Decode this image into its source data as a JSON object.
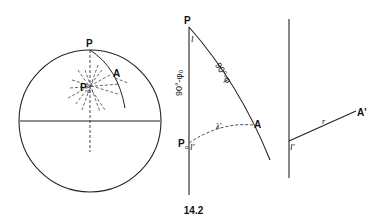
{
  "figure": {
    "caption": "14.2",
    "panel_left": {
      "label_pole": "P",
      "label_point": "A",
      "label_origin": "P",
      "label_origin_sub": "o"
    },
    "panel_middle": {
      "label_pole": "P",
      "label_point": "A",
      "label_origin": "P",
      "label_origin_sub": "o",
      "label_angle_top": "l",
      "label_angle_bottom": "l'",
      "label_side_left": "90°-φ₀",
      "label_side_right": "90°-φ",
      "label_arc": "λ'"
    },
    "panel_right": {
      "label_point": "A'",
      "label_angle": "l'",
      "label_radius": "r"
    }
  }
}
